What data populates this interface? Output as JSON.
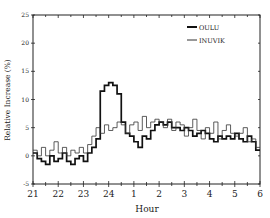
{
  "chart_data": {
    "type": "line",
    "style": "step",
    "title": "",
    "xlabel": "Hour",
    "ylabel": "Relative Increase (%)",
    "x_tick_labels": [
      "21",
      "22",
      "23",
      "24",
      "1",
      "2",
      "3",
      "4",
      "5",
      "6"
    ],
    "x_range_hours": [
      0,
      9
    ],
    "ylim": [
      -5,
      25
    ],
    "y_ticks": [
      -5,
      0,
      5,
      10,
      15,
      20,
      25
    ],
    "y_tick_labels": [
      "-5",
      "0",
      "5",
      "10",
      "15",
      "20",
      "25"
    ],
    "grid": false,
    "legend_position": "top-right",
    "bin_minutes": 10,
    "series": [
      {
        "name": "OULU",
        "line": "thick",
        "color": "#111111",
        "values": [
          0.5,
          -0.5,
          -1,
          -1.5,
          0,
          -1,
          -0.5,
          0.5,
          -1,
          -1.5,
          -0.5,
          0,
          -1,
          0.5,
          1.5,
          3,
          11.5,
          12.5,
          13,
          12.5,
          11,
          6,
          4,
          3.5,
          2.5,
          1.5,
          3.5,
          3,
          4.5,
          5.5,
          6,
          5.5,
          6,
          5,
          5,
          4.5,
          5,
          4.5,
          3.5,
          4,
          4.5,
          4,
          3,
          2.5,
          3.5,
          3,
          3.5,
          3,
          4,
          3,
          2.5,
          3.5,
          2.5,
          1
        ]
      },
      {
        "name": "INUVIK",
        "line": "thin",
        "color": "#333333",
        "values": [
          1,
          0,
          1.5,
          0,
          1,
          2.5,
          0.5,
          1.5,
          0,
          1,
          0.5,
          1.5,
          0.5,
          2,
          3.5,
          5,
          4,
          5.5,
          4.5,
          5,
          6,
          5.5,
          4,
          5.5,
          6,
          4.5,
          7,
          5,
          6,
          6.5,
          6,
          5,
          6.5,
          4.5,
          6,
          5.5,
          3.5,
          5,
          6.5,
          4.5,
          3,
          5,
          4,
          6,
          3,
          4.5,
          5.5,
          4,
          3.5,
          4,
          5,
          2.5,
          3,
          1.5
        ]
      }
    ]
  }
}
